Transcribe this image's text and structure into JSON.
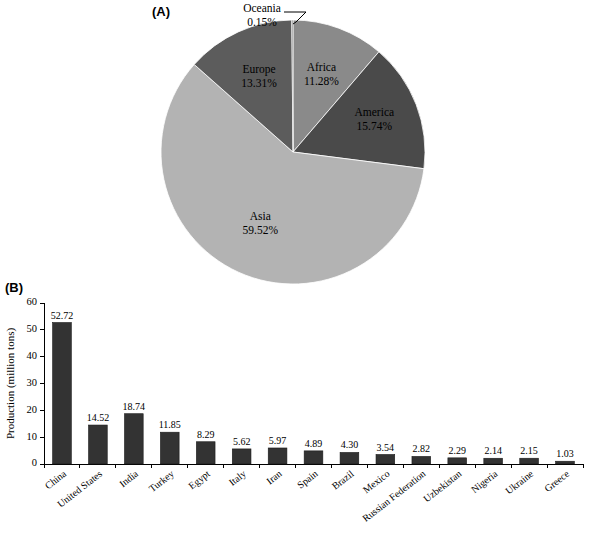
{
  "figure": {
    "panel_a_label": "(A)",
    "panel_b_label": "(B)"
  },
  "chart_data": [
    {
      "type": "pie",
      "title": "",
      "panel": "(A)",
      "labels": [
        "Africa",
        "America",
        "Asia",
        "Europe",
        "Oceania"
      ],
      "values": [
        11.28,
        15.74,
        59.52,
        13.31,
        0.15
      ],
      "value_labels": [
        "11.28%",
        "15.74%",
        "59.52%",
        "13.31%",
        "0.15%"
      ],
      "colors": [
        "#8a8a8a",
        "#4a4a4a",
        "#b3b3b3",
        "#5c5c5c",
        "#8a8a8a"
      ],
      "start_angle_deg": 0,
      "direction": "clockwise",
      "legend": "none",
      "slices": [
        {
          "name": "Africa",
          "percent": "11.28%",
          "value": 11.28,
          "color": "#8a8a8a",
          "label_placement": "inside"
        },
        {
          "name": "America",
          "percent": "15.74%",
          "value": 15.74,
          "color": "#4a4a4a",
          "label_placement": "inside"
        },
        {
          "name": "Asia",
          "percent": "59.52%",
          "value": 59.52,
          "color": "#b3b3b3",
          "label_placement": "inside"
        },
        {
          "name": "Europe",
          "percent": "13.31%",
          "value": 13.31,
          "color": "#5c5c5c",
          "label_placement": "inside"
        },
        {
          "name": "Oceania",
          "percent": "0.15%",
          "value": 0.15,
          "color": "#8a8a8a",
          "label_placement": "outside-leader"
        }
      ]
    },
    {
      "type": "bar",
      "panel": "(B)",
      "title": "",
      "xlabel": "",
      "ylabel": "Production (million tons)",
      "ylim": [
        0,
        60
      ],
      "ytick_step": 10,
      "yticks": [
        "0",
        "10",
        "20",
        "30",
        "40",
        "50",
        "60"
      ],
      "grid": false,
      "bar_color": "#333333",
      "categories": [
        "China",
        "United States",
        "India",
        "Turkey",
        "Egypt",
        "Italy",
        "Iran",
        "Spain",
        "Brazil",
        "Mexico",
        "Russian Federation",
        "Uzbekistan",
        "Nigeria",
        "Ukraine",
        "Greece"
      ],
      "values": [
        52.72,
        14.52,
        18.74,
        11.85,
        8.29,
        5.62,
        5.97,
        4.89,
        4.3,
        3.54,
        2.82,
        2.29,
        2.14,
        2.15,
        1.03
      ],
      "data_labels": [
        "52.72",
        "14.52",
        "18.74",
        "11.85",
        "8.29",
        "5.62",
        "5.97",
        "4.89",
        "4.30",
        "3.54",
        "2.82",
        "2.29",
        "2.14",
        "2.15",
        "1.03"
      ]
    }
  ]
}
